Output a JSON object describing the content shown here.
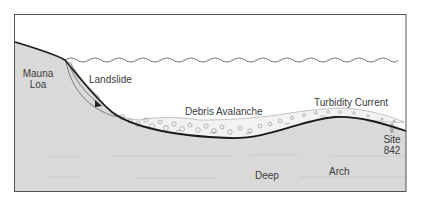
{
  "diagram": {
    "colors": {
      "land_fill": "#d9d9d9",
      "frame": "#444444",
      "profile_line": "#1a1a1a",
      "sea_line": "#555555",
      "text": "#3a3a3a",
      "debris": "#8a8a8a"
    },
    "labels": {
      "mauna_loa_line1": "Mauna",
      "mauna_loa_line2": "Loa",
      "landslide": "Landslide",
      "debris_avalanche": "Debris Avalanche",
      "turbidity_current": "Turbidity Current",
      "site_line1": "Site",
      "site_line2": "842",
      "deep": "Deep",
      "arch": "Arch"
    }
  }
}
